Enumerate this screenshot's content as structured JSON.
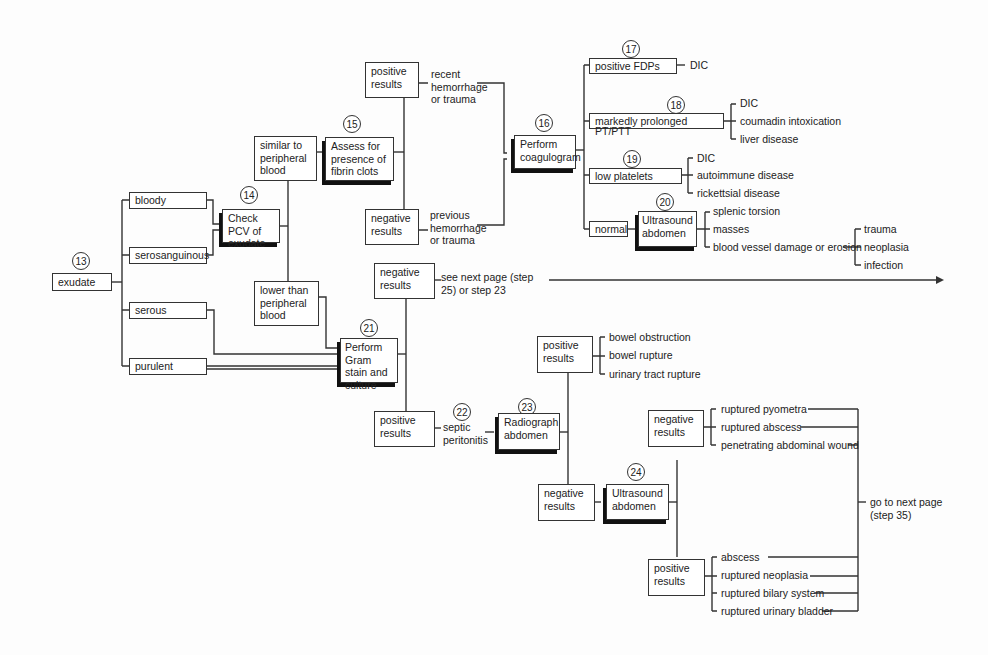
{
  "steps": {
    "s13": "13",
    "s14": "14",
    "s15": "15",
    "s16": "16",
    "s17": "17",
    "s18": "18",
    "s19": "19",
    "s20": "20",
    "s21": "21",
    "s22": "22",
    "s23": "23",
    "s24": "24"
  },
  "nodes": {
    "exudate": "exudate",
    "bloody": "bloody",
    "serosanguinous": "serosanguinous",
    "serous": "serous",
    "purulent": "purulent",
    "check_pcv": "Check PCV of exudate",
    "similar": "similar to peripheral blood",
    "lower": "lower than peripheral blood",
    "assess_fibrin": "Assess for presence of fibrin clots",
    "pos_results_15": "positive results",
    "neg_results_15": "negative results",
    "recent": "recent hemorrhage or trauma",
    "previous": "previous hemorrhage or trauma",
    "coagulogram": "Perform coagulogram",
    "positive_fdps": "positive FDPs",
    "prolonged": "markedly prolonged PT/PTT",
    "low_platelets": "low platelets",
    "normal": "normal",
    "ultrasound_20": "Ultrasound abdomen",
    "gram_stain": "Perform Gram stain and culture",
    "neg_results_21": "negative results",
    "see_next": "see next page (step 25) or step 23",
    "pos_results_21": "positive results",
    "septic": "septic peritonitis",
    "radiograph": "Radiograph abdomen",
    "pos_results_23": "positive results",
    "neg_results_23": "negative results",
    "ultrasound_24": "Ultrasound abdomen",
    "neg_results_24": "negative results",
    "pos_results_24": "positive results",
    "go_next": "go to next page (step 35)"
  },
  "outcomes": {
    "fdps": [
      "DIC"
    ],
    "prolonged": [
      "DIC",
      "coumadin intoxication",
      "liver disease"
    ],
    "platelets": [
      "DIC",
      "autoimmune disease",
      "rickettsial disease"
    ],
    "ultrasound_20": [
      "splenic torsion",
      "masses",
      "blood vessel damage or erosion"
    ],
    "vessel": [
      "trauma",
      "neoplasia",
      "infection"
    ],
    "radiograph_pos": [
      "bowel obstruction",
      "bowel rupture",
      "urinary tract rupture"
    ],
    "us24_neg": [
      "ruptured pyometra",
      "ruptured abscess",
      "penetrating abdominal wound"
    ],
    "us24_pos": [
      "abscess",
      "ruptured neoplasia",
      "ruptured bilary system",
      "ruptured urinary bladder"
    ]
  }
}
